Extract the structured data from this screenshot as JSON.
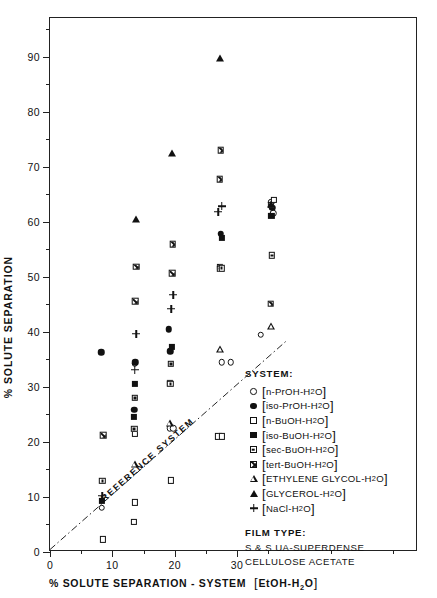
{
  "chart_data": {
    "type": "scatter",
    "title": "",
    "xlabel": "% SOLUTE SEPARATION - SYSTEM [EtOH-H2O]",
    "ylabel": "% SOLUTE SEPARATION",
    "xlim": [
      0,
      59
    ],
    "ylim": [
      0,
      97
    ],
    "xticks": [
      0,
      10,
      20,
      30
    ],
    "yticks": [
      0,
      10,
      20,
      30,
      40,
      50,
      60,
      70,
      80,
      90
    ],
    "grid": false,
    "legend_position": "inside-bottom-right",
    "reference_line": {
      "label": "REFERENCE SYSTEM",
      "style": "dash-dot",
      "from": [
        0,
        0
      ],
      "to": [
        38,
        38
      ]
    },
    "series": [
      {
        "name": "n-PrOH-H2O",
        "marker": "circle-open",
        "points": [
          [
            8.3,
            8.0
          ],
          [
            13.6,
            34.2
          ],
          [
            19.2,
            22.5
          ],
          [
            19.8,
            22.5
          ],
          [
            27.5,
            34.5
          ],
          [
            29.0,
            34.5
          ],
          [
            33.8,
            39.5
          ],
          [
            35.5,
            63.5
          ],
          [
            35.8,
            61.5
          ]
        ]
      },
      {
        "name": "iso-PrOH-H2O",
        "marker": "circle-filled",
        "points": [
          [
            8.2,
            36.3
          ],
          [
            13.7,
            34.5
          ],
          [
            13.5,
            25.8
          ],
          [
            19.0,
            40.5
          ],
          [
            19.3,
            36.5
          ],
          [
            27.4,
            57.8
          ],
          [
            35.6,
            62.5
          ]
        ]
      },
      {
        "name": "n-BuOH-H2O",
        "marker": "square-open",
        "points": [
          [
            8.5,
            2.3
          ],
          [
            13.5,
            5.5
          ],
          [
            13.6,
            9.0
          ],
          [
            13.6,
            21.5
          ],
          [
            19.4,
            13.0
          ],
          [
            27.0,
            21.0
          ],
          [
            27.6,
            21.0
          ],
          [
            35.4,
            63.0
          ],
          [
            35.9,
            64.0
          ]
        ]
      },
      {
        "name": "iso-BuOH-H2O",
        "marker": "square-filled",
        "points": [
          [
            8.3,
            9.3
          ],
          [
            13.4,
            24.5
          ],
          [
            13.6,
            30.5
          ],
          [
            19.2,
            30.7
          ],
          [
            19.5,
            37.3
          ],
          [
            27.2,
            51.8
          ],
          [
            27.5,
            57.0
          ],
          [
            35.5,
            61.0
          ]
        ]
      },
      {
        "name": "sec-BuOH-H2O",
        "marker": "square-dot",
        "points": [
          [
            8.4,
            12.9
          ],
          [
            13.5,
            23.5
          ],
          [
            13.6,
            30.3
          ],
          [
            19.3,
            34.0
          ],
          [
            19.4,
            38.8
          ],
          [
            27.3,
            57.3
          ],
          [
            27.5,
            58.5
          ],
          [
            35.6,
            62.0
          ]
        ]
      },
      {
        "name": "tert-BuOH-H2O",
        "marker": "square-x",
        "points": [
          [
            8.5,
            30.5
          ],
          [
            13.7,
            56.0
          ],
          [
            13.8,
            63.5
          ],
          [
            19.6,
            63.5
          ],
          [
            19.7,
            70.0
          ],
          [
            27.2,
            83.0
          ],
          [
            27.4,
            89.5
          ],
          [
            35.4,
            62.8
          ]
        ]
      },
      {
        "name": "ETHYLENE GLYCOL-H2O",
        "marker": "triangle-open",
        "points": [
          [
            13.6,
            34.8
          ],
          [
            19.2,
            43.5
          ],
          [
            27.3,
            58.2
          ],
          [
            35.5,
            63.8
          ]
        ]
      },
      {
        "name": "GLYCEROL-H2O",
        "marker": "triangle-filled",
        "points": [
          [
            13.8,
            60.5
          ],
          [
            19.5,
            72.5
          ],
          [
            27.3,
            89.8
          ],
          [
            35.5,
            63.3
          ]
        ]
      },
      {
        "name": "NaCl-H2O",
        "marker": "plus",
        "points": [
          [
            8.4,
            34.2
          ],
          [
            13.6,
            58.5
          ],
          [
            13.8,
            66.5
          ],
          [
            19.4,
            72.5
          ],
          [
            19.8,
            76.5
          ],
          [
            27.0,
            93.0
          ],
          [
            27.5,
            95.5
          ]
        ]
      }
    ]
  },
  "axes": {
    "y_title": "% SOLUTE SEPARATION",
    "x_title_prefix": "% SOLUTE  SEPARATION - SYSTEM",
    "x_title_bracket": "EtOH-H",
    "x_title_sub": "2",
    "x_title_end": "O",
    "y_tick_labels": [
      "0",
      "10",
      "20",
      "30",
      "40",
      "50",
      "60",
      "70",
      "80",
      "90"
    ],
    "x_tick_labels": [
      "0",
      "10",
      "20",
      "30"
    ]
  },
  "reference": {
    "label": "REFERENCE SYSTEM"
  },
  "legend": {
    "title": "SYSTEM:",
    "items": [
      {
        "symbol": "circle-open",
        "name": "n-PrOH-H",
        "sub": "2",
        "tail": "O"
      },
      {
        "symbol": "circle-filled",
        "name": "iso-PrOH-H",
        "sub": "2",
        "tail": "O"
      },
      {
        "symbol": "square-open",
        "name": "n-BuOH-H",
        "sub": "2",
        "tail": "O"
      },
      {
        "symbol": "square-filled",
        "name": "iso-BuOH-H",
        "sub": "2",
        "tail": "O"
      },
      {
        "symbol": "square-dot",
        "name": "sec-BuOH-H",
        "sub": "2",
        "tail": "O"
      },
      {
        "symbol": "square-x",
        "name": "tert-BuOH-H",
        "sub": "2",
        "tail": "O"
      },
      {
        "symbol": "triangle-open",
        "name": "ETHYLENE GLYCOL-H",
        "sub": "2",
        "tail": "O"
      },
      {
        "symbol": "triangle-filled",
        "name": "GLYCEROL-H",
        "sub": "2",
        "tail": "O"
      },
      {
        "symbol": "plus",
        "name": "NaCl-H",
        "sub": "2",
        "tail": "O"
      }
    ],
    "film_title": "FILM TYPE:",
    "film_lines": [
      "S & S UA-SUPERDENSE",
      "CELLULOSE ACETATE"
    ]
  }
}
